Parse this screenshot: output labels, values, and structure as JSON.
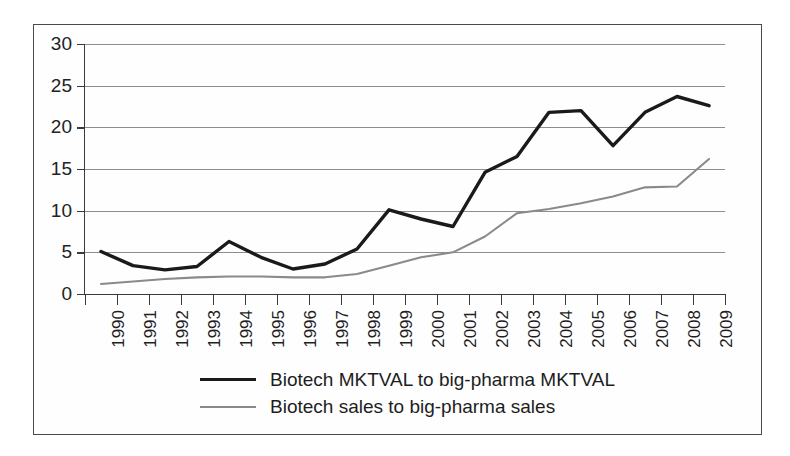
{
  "chart_data": {
    "type": "line",
    "title": "",
    "subtitle": "",
    "xlabel": "",
    "ylabel": "",
    "categories": [
      "1990",
      "1991",
      "1992",
      "1993",
      "1994",
      "1995",
      "1996",
      "1997",
      "1998",
      "1999",
      "2000",
      "2001",
      "2002",
      "2003",
      "2004",
      "2005",
      "2006",
      "2007",
      "2008",
      "2009"
    ],
    "ylim": [
      0,
      30
    ],
    "xlim_categories": 20,
    "y_ticks": [
      0,
      5,
      10,
      15,
      20,
      25,
      30
    ],
    "y_tick_labels": [
      "0",
      "5",
      "10",
      "15",
      "20",
      "25",
      "30"
    ],
    "grid": true,
    "grid_axis": "y",
    "legend_position": "bottom-center",
    "series": [
      {
        "name": "Biotech MKTVAL to big-pharma MKTVAL",
        "color": "#1a1a1a",
        "width": 3.4,
        "values": [
          5.1,
          3.4,
          2.9,
          3.3,
          6.3,
          4.4,
          3.0,
          3.6,
          5.4,
          10.1,
          9.0,
          8.1,
          14.6,
          16.5,
          21.8,
          22.0,
          17.8,
          21.8,
          23.7,
          22.6
        ]
      },
      {
        "name": "Biotech sales to big-pharma sales",
        "color": "#8a8a8a",
        "width": 2.1,
        "values": [
          1.2,
          1.5,
          1.8,
          2.0,
          2.1,
          2.1,
          2.0,
          2.0,
          2.4,
          3.4,
          4.4,
          5.0,
          6.9,
          9.7,
          10.2,
          10.9,
          11.7,
          12.8,
          12.9,
          16.2
        ]
      }
    ]
  },
  "legend": {
    "entries": [
      {
        "label": "Biotech MKTVAL to big-pharma MKTVAL",
        "style": "dark"
      },
      {
        "label": "Biotech sales to big-pharma sales",
        "style": "gray"
      }
    ]
  },
  "colors": {
    "series_dark": "#1a1a1a",
    "series_gray": "#8a8a8a",
    "gridline": "#8d8d8d",
    "axis": "#3a3a3a",
    "frame": "#4a4a4a",
    "background": "#ffffff",
    "text": "#1d1d1d"
  }
}
